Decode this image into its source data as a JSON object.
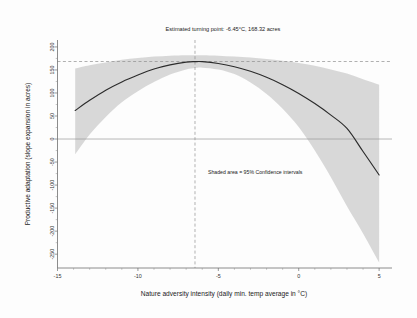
{
  "figure": {
    "background_color": "#fdfdfd",
    "title": "Estimated turning point: -6.45°C, 168.32 acres",
    "annotation": "Shaded area = 95% Confidence intervals"
  },
  "chart_data": {
    "type": "line",
    "title": "Estimated turning point: -6.45°C, 168.32 acres",
    "xlabel": "Nature adversity intensity (daily min. temp average in °C)",
    "ylabel": "Productive adaptation (slope expansion in acres)",
    "xlim": [
      -15.0,
      5.8
    ],
    "ylim": [
      -280,
      215
    ],
    "xticks": [
      -15,
      -10,
      -5,
      0,
      5
    ],
    "xtick_labels": [
      "-15",
      "-10",
      "-5",
      "0",
      "5"
    ],
    "yticks": [
      200,
      150,
      100,
      50,
      0,
      -50,
      -100,
      -150,
      -200,
      -250
    ],
    "ytick_labels": [
      "200",
      "150",
      "100",
      "50",
      "0",
      "-50",
      "-100",
      "-150",
      "-200",
      "-250"
    ],
    "grid": false,
    "legend_position": "none",
    "turning_point": {
      "x": -6.45,
      "y": 168.32,
      "label": "Estimated turning point: -6.45°C, 168.32 acres"
    },
    "reference_lines": [
      {
        "name": "zero-line",
        "orientation": "horizontal",
        "value": 0,
        "style": "solid",
        "color": "#9a9a9a"
      },
      {
        "name": "turning-point-y",
        "orientation": "horizontal",
        "value": 168.32,
        "style": "dashed",
        "color": "#8e8e8e"
      },
      {
        "name": "turning-point-x",
        "orientation": "vertical",
        "value": -6.45,
        "style": "dashed",
        "color": "#8e8e8e"
      }
    ],
    "annotations": [
      {
        "text": "Shaded area = 95% Confidence intervals",
        "x": -4.0,
        "y": -72
      }
    ],
    "series": [
      {
        "name": "Predicted productive adaptation",
        "type": "line",
        "color": "#2b2b2b",
        "x": [
          -13.9,
          -13.0,
          -12.0,
          -11.0,
          -10.0,
          -9.0,
          -8.0,
          -7.0,
          -6.45,
          -6.0,
          -5.0,
          -4.0,
          -3.0,
          -2.0,
          -1.0,
          0.0,
          1.0,
          2.0,
          3.0,
          4.0,
          5.0
        ],
        "y": [
          62,
          84,
          106,
          124,
          139,
          152,
          161,
          167,
          168,
          168,
          164,
          157,
          147,
          134,
          118,
          99,
          77,
          52,
          23,
          -27,
          -78
        ]
      },
      {
        "name": "95% confidence interval upper",
        "type": "band-upper",
        "color": "#d6d6d6",
        "x": [
          -13.9,
          -13.0,
          -12.0,
          -11.0,
          -10.0,
          -9.0,
          -8.0,
          -7.0,
          -6.45,
          -6.0,
          -5.0,
          -4.0,
          -3.0,
          -2.0,
          -1.0,
          0.0,
          1.0,
          2.0,
          3.0,
          4.0,
          5.0
        ],
        "y": [
          153,
          160,
          166,
          172,
          176,
          179,
          181,
          182,
          182,
          182,
          181,
          179,
          177,
          174,
          170,
          165,
          159,
          151,
          142,
          130,
          118
        ]
      },
      {
        "name": "95% confidence interval lower",
        "type": "band-lower",
        "color": "#d6d6d6",
        "x": [
          -13.9,
          -13.0,
          -12.0,
          -11.0,
          -10.0,
          -9.0,
          -8.0,
          -7.0,
          -6.45,
          -6.0,
          -5.0,
          -4.0,
          -3.0,
          -2.0,
          -1.0,
          0.0,
          1.0,
          2.0,
          3.0,
          4.0,
          5.0
        ],
        "y": [
          -33,
          10,
          48,
          80,
          104,
          124,
          140,
          151,
          154,
          155,
          151,
          141,
          123,
          98,
          66,
          26,
          -25,
          -83,
          -146,
          -205,
          -268
        ]
      }
    ]
  }
}
